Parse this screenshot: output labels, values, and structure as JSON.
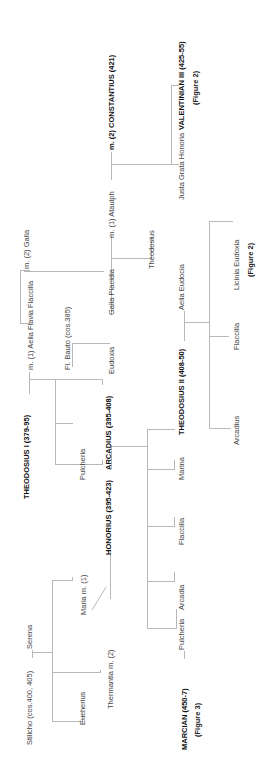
{
  "diagram": {
    "type": "family-tree",
    "orientation": "rotated-90-ccw",
    "people": {
      "theodosius_i": "THEODOSIUS  I (379-95)",
      "m1_aelia_flavia_flaccilla": "m. (1) Aelia Flavia  Flaccilla",
      "m2_galla": "m. (2) Galla",
      "serena": "Serena",
      "stilicho": "Stilicho (cos.400, 405)",
      "eucherius": "Eucherius",
      "maria": "Maria  m. (1)",
      "thermantia": "Thermantia  m. (2)",
      "pulcheria_ti": "Pulcheria",
      "honorius": "HONORIUS (395-423)",
      "arcadius": "ARCADIUS (395-408)",
      "fl_bauto": "Fl. Bauto (cos.385)",
      "eudoxia": "Eudoxia",
      "galla_placidia": "Galla Placidia",
      "m1_ataulph": "m. (1) Ataulph",
      "theodosius_gp": "Theodosius",
      "m2_constantius": "m. (2) CONSTANTIUS (421)",
      "justa_grata_honoria": "Justa Grata Honoria",
      "valentinian_iii": "VALENTINIAN  III (425-55)",
      "valentinian_iii_ref": "(Figure 2)",
      "aelia_eudocia": "Aelia Eudocia",
      "theodosius_ii": "THEODOSIUS II (408-50)",
      "licinia_eudoxia": "Licinia Eudoxia",
      "licinia_eudoxia_ref": "(Figure 2)",
      "flaccilla_tii": "Flaccilla",
      "arcadius_tii": "Arcadius",
      "marina": "Marina",
      "flaccilla_arc": "Flaccilla",
      "arcadia": "Arcadia",
      "pulcheria_arc": "Pulcheria",
      "marcian": "MARCIAN (450-7)",
      "marcian_ref": "(Figure 3)"
    },
    "colors": {
      "line": "#b8b8b8",
      "text": "#444444",
      "emperor_text": "#111111"
    }
  }
}
